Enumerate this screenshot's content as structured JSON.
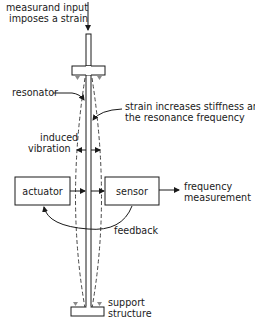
{
  "diagram": {
    "labels": {
      "input_line1": "measurand input",
      "input_line2": "imposes a strain",
      "resonator": "resonator",
      "strain_line1": "strain increases stiffness and",
      "strain_line2": "the resonance frequency",
      "vibration_line1": "induced",
      "vibration_line2": "vibration",
      "actuator": "actuator",
      "sensor": "sensor",
      "output_line1": "frequency",
      "output_line2": "measurement",
      "feedback": "feedback",
      "support_line1": "support",
      "support_line2": "structure"
    },
    "colors": {
      "stroke": "#1a1a1a",
      "dashed": "#333333",
      "support_marker": "#8a8a8a",
      "background": "#ffffff"
    }
  }
}
